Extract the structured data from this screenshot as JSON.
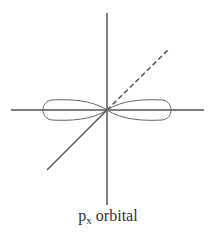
{
  "diagram": {
    "label_main": "p",
    "label_subscript": "x",
    "label_suffix": " orbital",
    "colors": {
      "axis": "#555555",
      "lobe": "#666666",
      "background": "#ffffff"
    },
    "axes": [
      "x-axis (horizontal)",
      "y-axis (vertical)",
      "z-axis (diagonal, dashed behind)"
    ],
    "lobes": 2
  }
}
